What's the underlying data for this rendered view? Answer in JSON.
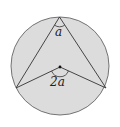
{
  "diagram": {
    "type": "geometry",
    "colors": {
      "fill": "#dcdcdc",
      "stroke": "#333333",
      "background": "#ffffff"
    },
    "labels": {
      "inscribed_angle": "a",
      "central_angle": "2a"
    }
  }
}
